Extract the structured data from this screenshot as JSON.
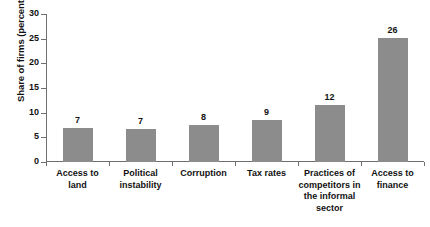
{
  "chart_data": {
    "type": "bar",
    "title": "",
    "subtitle": "",
    "xlabel": "",
    "ylabel": "Share of firms (percent)",
    "ylim": [
      0,
      30
    ],
    "ytick_values": [
      0,
      5,
      10,
      15,
      20,
      25,
      30
    ],
    "ytick_labels": [
      "0",
      "5",
      "10",
      "15",
      "20",
      "25",
      "30"
    ],
    "grid": false,
    "legend": "none",
    "bar_color": "#8c8c8c",
    "axis_color": "#6f6f6f",
    "background_color": "#ffffff",
    "categories": [
      "Access to land",
      "Political instability",
      "Corruption",
      "Tax rates",
      "Practices of competitors in the informal sector",
      "Access to finance"
    ],
    "values": [
      7,
      7,
      8,
      9,
      12,
      26
    ],
    "bar_heights": [
      6.8,
      6.7,
      7.6,
      8.6,
      11.5,
      25.2
    ],
    "data_labels": [
      "7",
      "7",
      "8",
      "9",
      "12",
      "26"
    ]
  },
  "category_lines": [
    [
      "Access to",
      "land"
    ],
    [
      "Political",
      "instability"
    ],
    [
      "Corruption"
    ],
    [
      "Tax rates"
    ],
    [
      "Practices of",
      "competitors in",
      "the informal",
      "sector"
    ],
    [
      "Access to",
      "finance"
    ]
  ]
}
